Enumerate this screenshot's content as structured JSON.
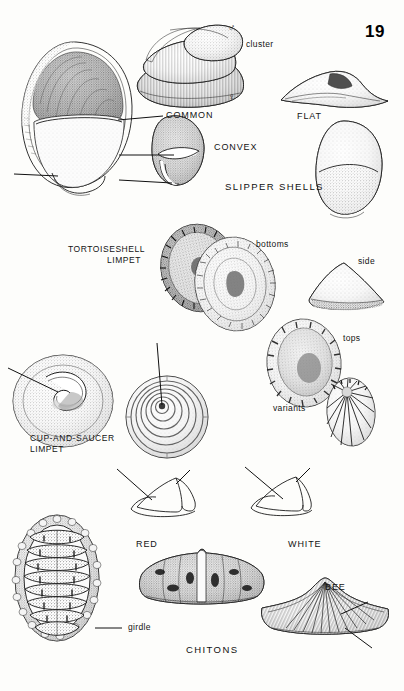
{
  "page": {
    "folio": "19",
    "width": 404,
    "height": 691,
    "background": "#fdfdfb",
    "ink_color": "#1a1a1a"
  },
  "plate": {
    "title_slipper": "SLIPPER SHELLS",
    "title_chitons": "CHITONS"
  },
  "labels": {
    "common": "COMMON",
    "convex": "CONVEX",
    "flat": "FLAT",
    "cluster": "cluster",
    "male_symbol": "♂",
    "female_symbol": "♀",
    "tortoiseshell_limpet_line1": "TORTOISESHELL",
    "tortoiseshell_limpet_line2": "LIMPET",
    "bottoms": "bottoms",
    "side": "side",
    "tops": "tops",
    "variants": "variants",
    "cup_and_saucer_line1": "CUP-AND-SAUCER",
    "cup_and_saucer_line2": "LIMPET",
    "red": "RED",
    "white": "WHITE",
    "bee": "BEE",
    "girdle": "girdle"
  },
  "figures": [
    {
      "name": "common-slipper-shell-interior",
      "label": "COMMON"
    },
    {
      "name": "slipper-shell-cluster",
      "label": "cluster"
    },
    {
      "name": "convex-slipper-shell",
      "label": "CONVEX"
    },
    {
      "name": "flat-slipper-shell-side",
      "label": "FLAT"
    },
    {
      "name": "flat-slipper-shell-top",
      "label": "FLAT"
    },
    {
      "name": "tortoiseshell-limpet-bottoms",
      "label": "bottoms"
    },
    {
      "name": "limpet-side-view",
      "label": "side"
    },
    {
      "name": "limpet-top-view",
      "label": "tops"
    },
    {
      "name": "limpet-variant",
      "label": "variants"
    },
    {
      "name": "cup-and-saucer-limpet-interior",
      "label": "CUP-AND-SAUCER LIMPET"
    },
    {
      "name": "cup-and-saucer-limpet-exterior",
      "label": "CUP-AND-SAUCER LIMPET"
    },
    {
      "name": "red-chiton-plate-diagram",
      "label": "RED"
    },
    {
      "name": "white-chiton-plate-diagram",
      "label": "WHITE"
    },
    {
      "name": "chiton-dorsal-view-girdle",
      "label": "girdle"
    },
    {
      "name": "red-chiton-body",
      "label": "RED"
    },
    {
      "name": "bee-chiton-body",
      "label": "BEE"
    }
  ]
}
